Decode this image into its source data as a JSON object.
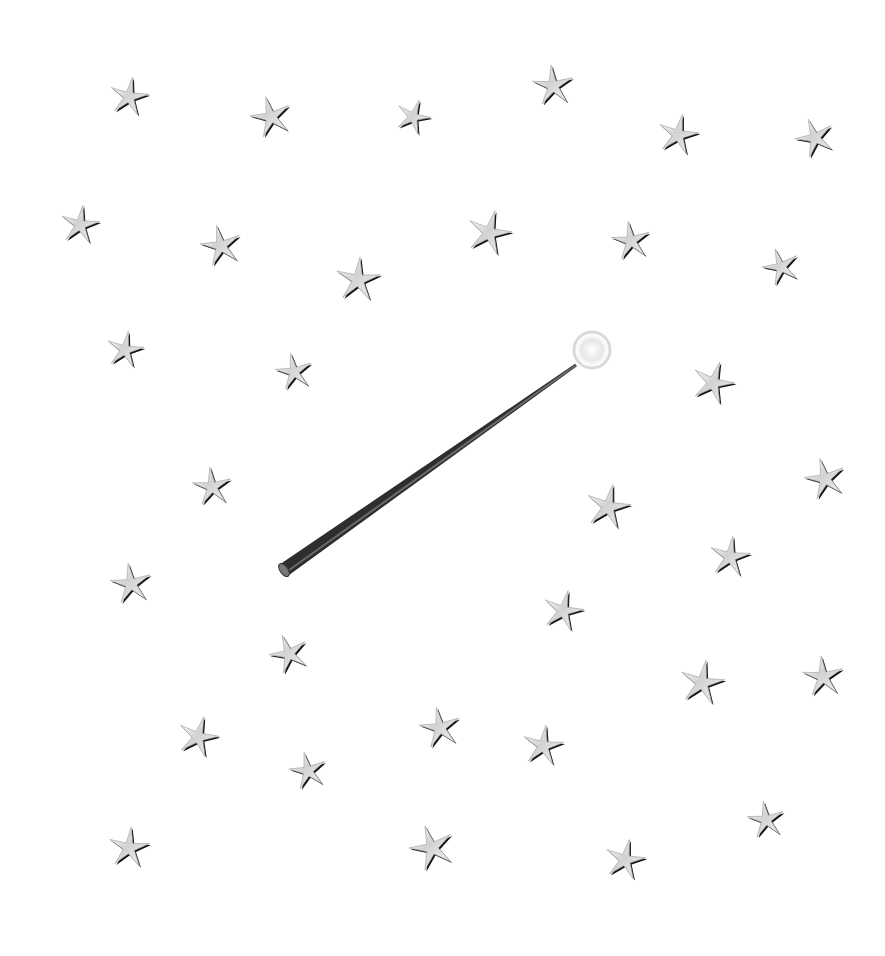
{
  "canvas": {
    "width": 885,
    "height": 956,
    "background": "#ffffff"
  },
  "wand": {
    "base": [
      284,
      570
    ],
    "tip": [
      576,
      365
    ],
    "color_dark": "#2e2e2e",
    "color_mid": "#6a6a6a",
    "sparkle_center": [
      592,
      350
    ],
    "sparkle_color": "#d9d9d9"
  },
  "stars": [
    {
      "x": 129,
      "y": 97,
      "s": 20,
      "r": 10
    },
    {
      "x": 271,
      "y": 117,
      "s": 21,
      "r": -15
    },
    {
      "x": 413,
      "y": 117,
      "s": 18,
      "r": 20
    },
    {
      "x": 553,
      "y": 86,
      "s": 21,
      "r": -5
    },
    {
      "x": 678,
      "y": 135,
      "s": 21,
      "r": 12
    },
    {
      "x": 815,
      "y": 138,
      "s": 20,
      "r": -20
    },
    {
      "x": 80,
      "y": 225,
      "s": 20,
      "r": 8
    },
    {
      "x": 221,
      "y": 246,
      "s": 21,
      "r": -12
    },
    {
      "x": 489,
      "y": 233,
      "s": 23,
      "r": 15
    },
    {
      "x": 631,
      "y": 241,
      "s": 20,
      "r": -8
    },
    {
      "x": 358,
      "y": 280,
      "s": 23,
      "r": 5
    },
    {
      "x": 781,
      "y": 267,
      "s": 19,
      "r": -18
    },
    {
      "x": 125,
      "y": 350,
      "s": 19,
      "r": 10
    },
    {
      "x": 294,
      "y": 372,
      "s": 19,
      "r": -10
    },
    {
      "x": 713,
      "y": 383,
      "s": 22,
      "r": 18
    },
    {
      "x": 212,
      "y": 487,
      "s": 20,
      "r": -6
    },
    {
      "x": 608,
      "y": 507,
      "s": 23,
      "r": 12
    },
    {
      "x": 825,
      "y": 479,
      "s": 21,
      "r": -14
    },
    {
      "x": 730,
      "y": 557,
      "s": 21,
      "r": 8
    },
    {
      "x": 131,
      "y": 584,
      "s": 21,
      "r": -8
    },
    {
      "x": 563,
      "y": 611,
      "s": 21,
      "r": 14
    },
    {
      "x": 289,
      "y": 654,
      "s": 20,
      "r": -20
    },
    {
      "x": 702,
      "y": 683,
      "s": 23,
      "r": 10
    },
    {
      "x": 823,
      "y": 677,
      "s": 21,
      "r": -5
    },
    {
      "x": 198,
      "y": 737,
      "s": 21,
      "r": 16
    },
    {
      "x": 440,
      "y": 728,
      "s": 21,
      "r": -10
    },
    {
      "x": 543,
      "y": 746,
      "s": 21,
      "r": 8
    },
    {
      "x": 308,
      "y": 771,
      "s": 19,
      "r": -12
    },
    {
      "x": 129,
      "y": 848,
      "s": 21,
      "r": 6
    },
    {
      "x": 432,
      "y": 848,
      "s": 23,
      "r": -18
    },
    {
      "x": 625,
      "y": 860,
      "s": 21,
      "r": 12
    },
    {
      "x": 766,
      "y": 820,
      "s": 19,
      "r": -8
    }
  ]
}
